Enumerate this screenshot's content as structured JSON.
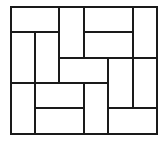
{
  "diagram": {
    "title": "",
    "stroke_color": "#1a1a1a",
    "background_color": "#ffffff",
    "stroke_width": 2,
    "frame": {
      "x": 11,
      "y": 7,
      "width": 146,
      "height": 127
    },
    "grid": {
      "cols": 6,
      "rows": 5
    },
    "col_edges": [
      11,
      35,
      59,
      84,
      108,
      133,
      157
    ],
    "row_edges": [
      7,
      32,
      58,
      83,
      108,
      134
    ],
    "pieces": [
      {
        "id": "p1",
        "orientation": "horizontal",
        "col": 0,
        "row": 0,
        "colspan": 2,
        "rowspan": 1
      },
      {
        "id": "p2",
        "orientation": "vertical",
        "col": 2,
        "row": 0,
        "colspan": 1,
        "rowspan": 2
      },
      {
        "id": "p3",
        "orientation": "horizontal",
        "col": 3,
        "row": 0,
        "colspan": 2,
        "rowspan": 1
      },
      {
        "id": "p4",
        "orientation": "horizontal",
        "col": 3,
        "row": 1,
        "colspan": 2,
        "rowspan": 1
      },
      {
        "id": "p5",
        "orientation": "vertical",
        "col": 5,
        "row": 0,
        "colspan": 1,
        "rowspan": 2
      },
      {
        "id": "p6",
        "orientation": "vertical",
        "col": 0,
        "row": 1,
        "colspan": 1,
        "rowspan": 2
      },
      {
        "id": "p7",
        "orientation": "vertical",
        "col": 1,
        "row": 1,
        "colspan": 1,
        "rowspan": 2
      },
      {
        "id": "p8",
        "orientation": "horizontal",
        "col": 2,
        "row": 2,
        "colspan": 2,
        "rowspan": 1
      },
      {
        "id": "p9",
        "orientation": "vertical",
        "col": 4,
        "row": 2,
        "colspan": 1,
        "rowspan": 2
      },
      {
        "id": "p10",
        "orientation": "vertical",
        "col": 5,
        "row": 2,
        "colspan": 1,
        "rowspan": 2
      },
      {
        "id": "p11",
        "orientation": "vertical",
        "col": 0,
        "row": 3,
        "colspan": 1,
        "rowspan": 2
      },
      {
        "id": "p12",
        "orientation": "horizontal",
        "col": 1,
        "row": 3,
        "colspan": 2,
        "rowspan": 1
      },
      {
        "id": "p13",
        "orientation": "horizontal",
        "col": 1,
        "row": 4,
        "colspan": 2,
        "rowspan": 1
      },
      {
        "id": "p14",
        "orientation": "vertical",
        "col": 3,
        "row": 3,
        "colspan": 1,
        "rowspan": 2
      },
      {
        "id": "p15",
        "orientation": "horizontal",
        "col": 4,
        "row": 4,
        "colspan": 2,
        "rowspan": 1
      }
    ]
  }
}
